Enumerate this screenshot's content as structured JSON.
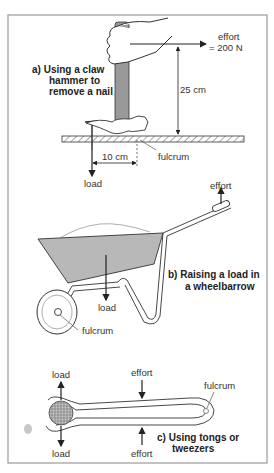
{
  "diagram": {
    "panel_a": {
      "caption_line1": "a)  Using a claw",
      "caption_line2": "hammer to",
      "caption_line3": "remove a nail",
      "effort_label": "effort",
      "effort_value": "= 200 N",
      "height_label": "25 cm",
      "distance_label": "10 cm",
      "fulcrum_label": "fulcrum",
      "load_label": "load"
    },
    "panel_b": {
      "caption_line1": "b)  Raising a load in",
      "caption_line2": "a wheelbarrow",
      "effort_label": "effort",
      "load_label": "load",
      "fulcrum_label": "fulcrum"
    },
    "panel_c": {
      "caption_line1": "c)  Using tongs or",
      "caption_line2": "tweezers",
      "load_top_label": "load",
      "load_bottom_label": "load",
      "effort_top_label": "effort",
      "effort_bottom_label": "effort",
      "fulcrum_label": "fulcrum"
    },
    "colors": {
      "frame": "#9a9a9a",
      "fill_grey": "#b8b8b8",
      "handle_grey": "#999999",
      "line": "#222222"
    }
  }
}
